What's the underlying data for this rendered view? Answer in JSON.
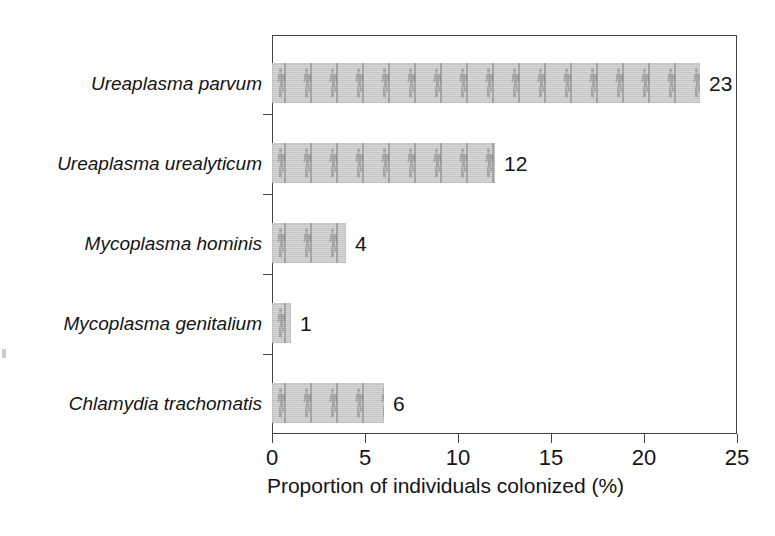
{
  "chart_data": {
    "type": "bar",
    "orientation": "horizontal",
    "title": "",
    "subtitle": "",
    "xlabel": "Proportion of individuals colonized (%)",
    "ylabel": "",
    "categories": [
      "Ureaplasma parvum",
      "Ureaplasma urealyticum",
      "Mycoplasma hominis",
      "Mycoplasma genitalium",
      "Chlamydia trachomatis"
    ],
    "values": [
      23,
      12,
      4,
      1,
      6
    ],
    "value_labels": [
      "23",
      "12",
      "4",
      "1",
      "6"
    ],
    "xlim": [
      0,
      25
    ],
    "xticks": [
      0,
      5,
      10,
      15,
      20,
      25
    ],
    "xtick_labels": [
      "0",
      "5",
      "10",
      "15",
      "20",
      "25"
    ],
    "grid": false,
    "legend": false,
    "bar_fill": "#c9c9c9",
    "bar_pattern": "human-figure-silhouettes",
    "axis_color": "#444444",
    "text_color": "#141414",
    "background": "#ffffff"
  },
  "figure": {
    "axis_title": "Proportion of individuals colonized (%)"
  }
}
